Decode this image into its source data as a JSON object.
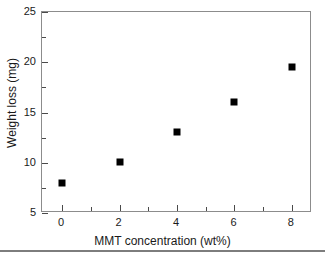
{
  "chart_data": {
    "type": "scatter",
    "title": "",
    "xlabel": "MMT concentration (wt%)",
    "ylabel": "Weight loss (mg)",
    "x": [
      0,
      2,
      4,
      6,
      8
    ],
    "values": [
      8.0,
      10.1,
      13.1,
      16.0,
      19.5
    ],
    "series": [
      {
        "name": "Weight loss",
        "marker": "filled-square",
        "color": "#000000",
        "values": [
          8.0,
          10.1,
          13.1,
          16.0,
          19.5
        ]
      }
    ],
    "xlim": [
      -0.7,
      8.7
    ],
    "ylim": [
      5,
      25
    ],
    "x_major_ticks": [
      0,
      2,
      4,
      6,
      8
    ],
    "x_minor_ticks": [
      1,
      3,
      5,
      7
    ],
    "y_major_ticks": [
      5,
      10,
      15,
      20,
      25
    ],
    "y_minor_ticks": [
      7.5,
      12.5,
      17.5,
      22.5
    ],
    "x_tick_labels": [
      "0",
      "2",
      "4",
      "6",
      "8"
    ],
    "y_tick_labels": [
      "5",
      "10",
      "15",
      "20",
      "25"
    ],
    "grid": false,
    "legend": false,
    "frame_color": "#8c8c8c",
    "tick_direction": "in"
  },
  "figure": {
    "axis_title_x": "MMT concentration (wt%)",
    "axis_title_y": "Weight loss (mg)"
  }
}
